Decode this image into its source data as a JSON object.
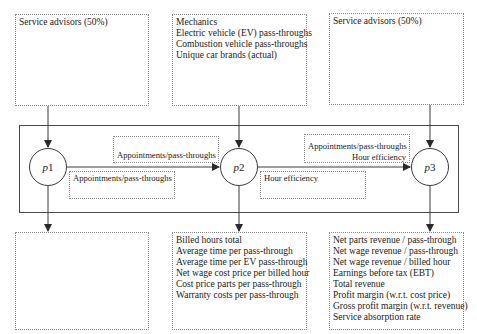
{
  "inputs": [
    {
      "id": "input-p1",
      "lines": [
        "Service advisors (50%)"
      ]
    },
    {
      "id": "input-p2",
      "lines": [
        "Mechanics",
        "Electric vehicle (EV) pass-throughs",
        "Combustion vehicle pass-throughs",
        "Unique car brands (actual)"
      ]
    },
    {
      "id": "input-p3",
      "lines": [
        "Service advisors (50%)"
      ]
    }
  ],
  "nodes": [
    {
      "id": "p1",
      "letter": "p",
      "number": "1"
    },
    {
      "id": "p2",
      "letter": "p",
      "number": "2"
    },
    {
      "id": "p3",
      "letter": "p",
      "number": "3"
    }
  ],
  "edge_labels": {
    "p1_to_p2_above": [
      "Appointments/pass-throughs"
    ],
    "p1_to_p2_below": [
      "Appointments/pass-throughs"
    ],
    "p2_to_p3_above": [
      "Appointments/pass-throughs",
      "Hour efficiency"
    ],
    "p2_to_p3_below": [
      "Hour efficiency"
    ]
  },
  "outputs": [
    {
      "id": "output-p1",
      "lines": []
    },
    {
      "id": "output-p2",
      "lines": [
        "Billed hours total",
        "Average time per pass-through",
        "Average time per EV pass-through",
        "Net wage cost price per billed hour",
        "Cost price parts per pass-through",
        "Warranty costs per pass-through"
      ]
    },
    {
      "id": "output-p3",
      "lines": [
        "Net parts revenue / pass-through",
        "Net wage revenue / pass-through",
        "Net wage revenue / billed hour",
        "Earnings before tax (EBT)",
        "Total revenue",
        "Profit margin (w.r.t. cost price)",
        "Gross profit margin (w.r.t. revenue)",
        "Service absorption rate"
      ]
    }
  ],
  "colors": {
    "line": "#3a3a3a",
    "dotted_border": "#8a8a8a",
    "text": "#1a1a1a",
    "background": "#ffffff"
  }
}
